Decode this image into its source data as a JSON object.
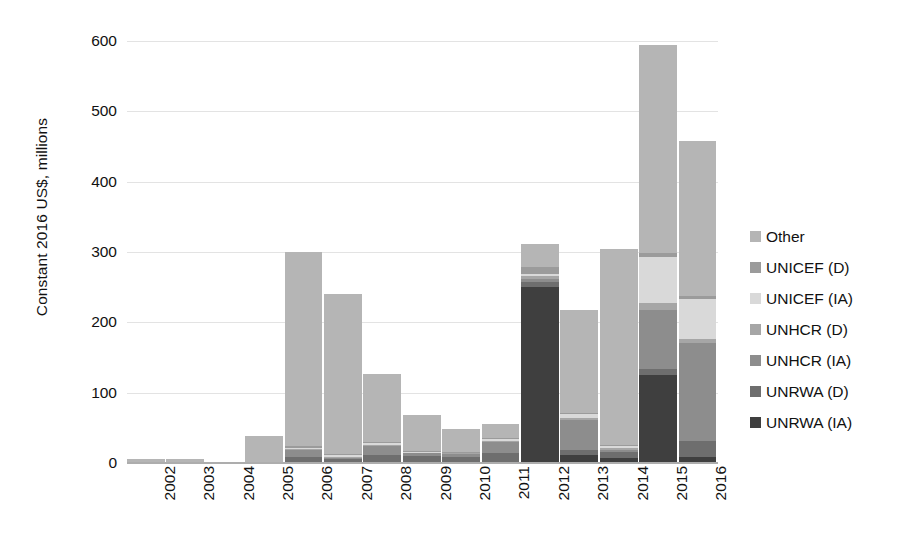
{
  "chart_data": {
    "type": "bar",
    "stacked": true,
    "title": "",
    "subtitle": "",
    "xlabel": "",
    "ylabel": "Constant 2016 US$, millions",
    "ylim": [
      0,
      600
    ],
    "yticks": [
      0,
      100,
      200,
      300,
      400,
      500,
      600
    ],
    "ytick_labels": [
      "0",
      "100",
      "200",
      "300",
      "400",
      "500",
      "600"
    ],
    "grid": "horizontal",
    "legend_position": "right",
    "categories": [
      "2002",
      "2003",
      "2004",
      "2005",
      "2006",
      "2007",
      "2008",
      "2009",
      "2010",
      "2011",
      "2012",
      "2013",
      "2014",
      "2015",
      "2016"
    ],
    "series": [
      {
        "name": "UNRWA (IA)",
        "color": "#3f3f3f",
        "values": [
          0,
          0,
          0,
          0,
          2,
          2,
          2,
          1,
          1,
          2,
          250,
          11,
          7,
          125,
          9
        ]
      },
      {
        "name": "UNRWA (D)",
        "color": "#6e6e6e",
        "values": [
          0,
          0,
          0,
          0,
          6,
          4,
          10,
          9,
          8,
          12,
          7,
          8,
          8,
          8,
          22
        ]
      },
      {
        "name": "UNHCR (IA)",
        "color": "#8d8d8d",
        "values": [
          0,
          0,
          0,
          0,
          10,
          1,
          12,
          4,
          4,
          16,
          5,
          42,
          4,
          84,
          140
        ]
      },
      {
        "name": "UNHCR (D)",
        "color": "#a6a6a6",
        "values": [
          0,
          0,
          0,
          0,
          2,
          2,
          2,
          1,
          1,
          2,
          4,
          3,
          2,
          10,
          5
        ]
      },
      {
        "name": "UNICEF (IA)",
        "color": "#d9d9d9",
        "values": [
          0,
          0,
          0,
          0,
          2,
          2,
          2,
          1,
          1,
          2,
          3,
          5,
          3,
          66,
          57
        ]
      },
      {
        "name": "UNICEF (D)",
        "color": "#9b9b9b",
        "values": [
          0,
          0,
          0,
          0,
          2,
          2,
          2,
          1,
          1,
          2,
          10,
          2,
          2,
          6,
          4
        ]
      },
      {
        "name": "Other",
        "color": "#b5b5b5",
        "values": [
          5,
          5,
          2,
          38,
          276,
          227,
          96,
          51,
          33,
          19,
          33,
          147,
          279,
          296,
          221
        ]
      }
    ],
    "totals": [
      5,
      5,
      2,
      38,
      298,
      240,
      126,
      68,
      49,
      55,
      312,
      218,
      305,
      595,
      458
    ]
  },
  "legend": {
    "items": [
      {
        "label": "Other",
        "color": "#b5b5b5"
      },
      {
        "label": "UNICEF (D)",
        "color": "#9b9b9b"
      },
      {
        "label": "UNICEF (IA)",
        "color": "#d9d9d9"
      },
      {
        "label": "UNHCR (D)",
        "color": "#a6a6a6"
      },
      {
        "label": "UNHCR (IA)",
        "color": "#8d8d8d"
      },
      {
        "label": "UNRWA (D)",
        "color": "#6e6e6e"
      },
      {
        "label": "UNRWA (IA)",
        "color": "#3f3f3f"
      }
    ]
  },
  "axes": {
    "y_title": "Constant 2016 US$, millions",
    "y_tick_labels": [
      "600",
      "500",
      "400",
      "300",
      "200",
      "100",
      "0"
    ],
    "x_tick_labels": [
      "2002",
      "2003",
      "2004",
      "2005",
      "2006",
      "2007",
      "2008",
      "2009",
      "2010",
      "2011",
      "2012",
      "2013",
      "2014",
      "2015",
      "2016"
    ]
  },
  "colors": {
    "gridline": "#e3e3e3",
    "axis": "#adadad",
    "text": "#111111",
    "background": "#ffffff"
  }
}
